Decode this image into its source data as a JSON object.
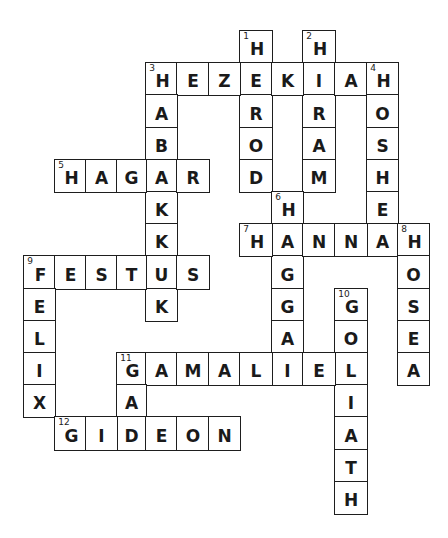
{
  "puzzle": {
    "title": "",
    "theme_color_line": "#1e1e1e",
    "theme_color_text": "#1a1a1a",
    "layout": {
      "column_x": {
        "-4": 24,
        "-3": 55,
        "-2": 86,
        "-1": 117,
        "0": 146,
        "1": 177,
        "2": 209,
        "3": 240,
        "4": 272,
        "5": 303,
        "6": 335,
        "7": 367,
        "8": 398,
        "9": 429
      },
      "row_y0": 31,
      "row_pitch": 32.2
    },
    "words": [
      {
        "number": 1,
        "direction": "down",
        "answer": "HEROD",
        "col": 3,
        "row": 0
      },
      {
        "number": 2,
        "direction": "down",
        "answer": "HIRAM",
        "col": 5,
        "row": 0
      },
      {
        "number": 3,
        "direction": "across",
        "answer": "HEZEKIAH",
        "col": 0,
        "row": 1
      },
      {
        "number": 3,
        "direction": "down",
        "answer": "HABAKKUK",
        "col": 0,
        "row": 1
      },
      {
        "number": 4,
        "direction": "down",
        "answer": "HOSHEA",
        "col": 7,
        "row": 1
      },
      {
        "number": 5,
        "direction": "across",
        "answer": "HAGAR",
        "col": -3,
        "row": 4
      },
      {
        "number": 6,
        "direction": "down",
        "answer": "HAGGAI",
        "col": 4,
        "row": 5
      },
      {
        "number": 7,
        "direction": "across",
        "answer": "HANNAH",
        "col": 3,
        "row": 6
      },
      {
        "number": 8,
        "direction": "down",
        "answer": "HOSEA",
        "col": 8,
        "row": 6
      },
      {
        "number": 9,
        "direction": "across",
        "answer": "FESTUS",
        "col": -4,
        "row": 7
      },
      {
        "number": 9,
        "direction": "down",
        "answer": "FELIX",
        "col": -4,
        "row": 7
      },
      {
        "number": 10,
        "direction": "down",
        "answer": "GOLIATH",
        "col": 6,
        "row": 8
      },
      {
        "number": 11,
        "direction": "across",
        "answer": "GAMALIEL",
        "col": -1,
        "row": 10
      },
      {
        "number": 11,
        "direction": "down",
        "answer": "GAD",
        "col": -1,
        "row": 10
      },
      {
        "number": 12,
        "direction": "across",
        "answer": "GIDEON",
        "col": -3,
        "row": 12
      }
    ]
  }
}
